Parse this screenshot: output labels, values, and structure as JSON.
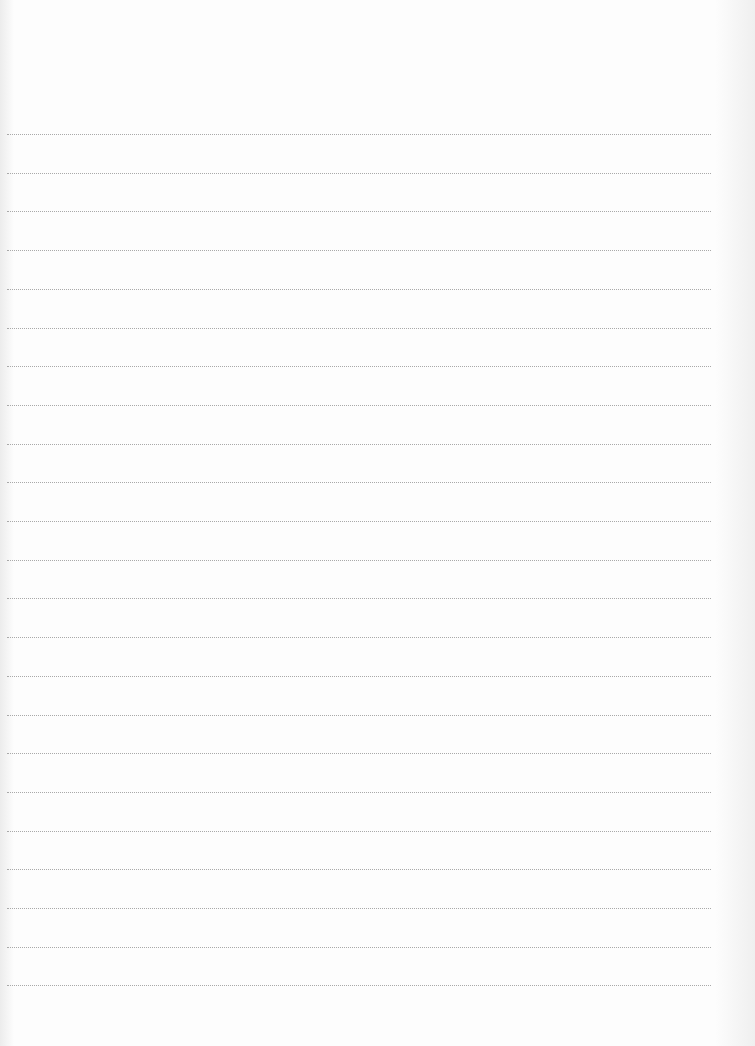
{
  "page": {
    "type": "dotted-ruled-notebook-page",
    "background": "#fdfdfd",
    "line_color": "#a9a9a9",
    "line_style": "dotted",
    "line_left_px": 7,
    "line_width_px": 704,
    "first_line_y_px": 134,
    "line_spacing_px": 38.7,
    "line_count": 23,
    "content_text": ""
  }
}
